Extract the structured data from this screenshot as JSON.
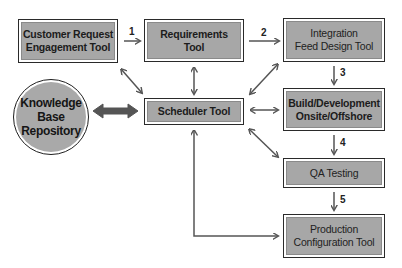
{
  "diagram": {
    "nodes": {
      "customer_request": {
        "label": "Customer Request\nEngagement Tool"
      },
      "requirements": {
        "label": "Requirements\nTool"
      },
      "integration": {
        "label": "Integration\nFeed Design Tool"
      },
      "build_dev": {
        "label": "Build/Development\nOnsite/Offshore"
      },
      "scheduler": {
        "label": "Scheduler Tool"
      },
      "qa": {
        "label": "QA Testing"
      },
      "production": {
        "label": "Production\nConfiguration Tool"
      },
      "knowledge_base": {
        "label": "Knowledge\nBase\nRepository"
      }
    },
    "steps": [
      "1",
      "2",
      "3",
      "4",
      "5"
    ],
    "edges": [
      {
        "from": "Customer Request Engagement Tool",
        "to": "Requirements Tool",
        "label": "1",
        "type": "directed"
      },
      {
        "from": "Requirements Tool",
        "to": "Integration Feed Design Tool",
        "label": "2",
        "type": "directed"
      },
      {
        "from": "Integration Feed Design Tool",
        "to": "Build/Development Onsite/Offshore",
        "label": "3",
        "type": "directed"
      },
      {
        "from": "Build/Development Onsite/Offshore",
        "to": "QA Testing",
        "label": "4",
        "type": "directed"
      },
      {
        "from": "QA Testing",
        "to": "Production Configuration Tool",
        "label": "5",
        "type": "directed"
      },
      {
        "from": "Scheduler Tool",
        "to": "Customer Request Engagement Tool",
        "type": "bidirectional"
      },
      {
        "from": "Scheduler Tool",
        "to": "Requirements Tool",
        "type": "bidirectional"
      },
      {
        "from": "Scheduler Tool",
        "to": "Integration Feed Design Tool",
        "type": "bidirectional"
      },
      {
        "from": "Scheduler Tool",
        "to": "Build/Development Onsite/Offshore",
        "type": "bidirectional"
      },
      {
        "from": "Scheduler Tool",
        "to": "QA Testing",
        "type": "bidirectional"
      },
      {
        "from": "Scheduler Tool",
        "to": "Production Configuration Tool",
        "type": "bidirectional"
      },
      {
        "from": "Knowledge Base Repository",
        "to": "Scheduler Tool",
        "type": "bidirectional-thick"
      }
    ],
    "colors": {
      "box_fill": "#a7a7a7",
      "border": "#2a2a2a",
      "arrow": "#555555",
      "thick_arrow": "#555555"
    }
  }
}
